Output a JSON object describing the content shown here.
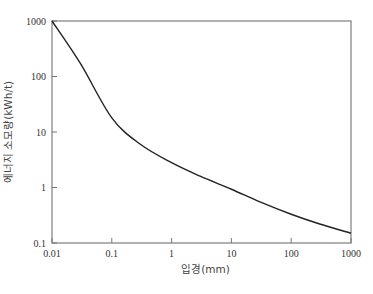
{
  "chart_data": {
    "type": "line",
    "title": "",
    "xlabel": "입경(mm)",
    "ylabel": "에너지 소모량(kWh/t)",
    "xscale": "log",
    "yscale": "log",
    "xlim": [
      0.01,
      1000
    ],
    "ylim": [
      0.1,
      1000
    ],
    "grid": false,
    "legend": null,
    "x_ticks": [
      "0.01",
      "0.1",
      "1",
      "10",
      "100",
      "1000"
    ],
    "y_ticks": [
      "0.1",
      "1",
      "10",
      "100",
      "1000"
    ],
    "series": [
      {
        "name": "energy consumption",
        "color": "#222222",
        "x": [
          0.01,
          0.03,
          0.1,
          0.3,
          1,
          3,
          10,
          30,
          100,
          300,
          1000
        ],
        "y": [
          1000,
          170,
          18,
          6.0,
          2.8,
          1.6,
          0.93,
          0.55,
          0.33,
          0.22,
          0.15
        ]
      }
    ]
  },
  "plot": {
    "left": 52,
    "right": 351,
    "top": 21,
    "bottom": 243,
    "axis_color": "#777777",
    "frame_color": "#888888"
  }
}
